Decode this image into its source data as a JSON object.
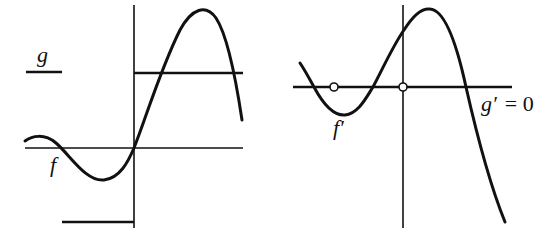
{
  "figure": {
    "left_panel": {
      "function_label": "f",
      "step_function_label": "g",
      "description": "f is smooth through origin; g is a step function: negative constant for x<0, positive constant for x>0"
    },
    "right_panel": {
      "derivative_label": "f′",
      "g_derivative_label": "g′ = 0",
      "g_prime_symbol": "g′",
      "equals_zero": "= 0",
      "open_circles": 2,
      "description": "f' drawn with g' = 0 along the horizontal axis; open circles mark points where g' is undefined / removed"
    },
    "colors": {
      "ink": "#111111",
      "background": "#ffffff"
    }
  }
}
